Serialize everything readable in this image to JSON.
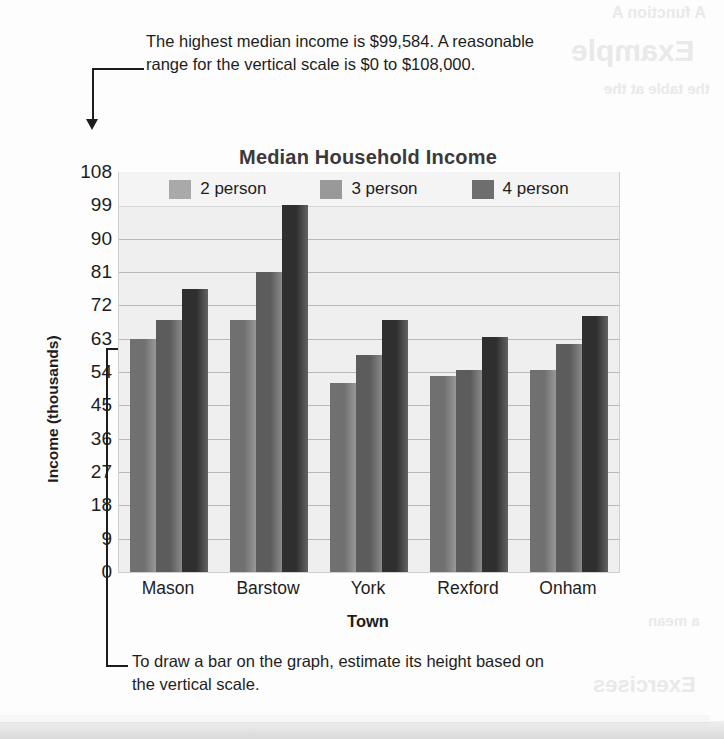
{
  "annotations": {
    "top": "The highest median income is $99,584. A reasonable range for the vertical scale is $0 to $108,000.",
    "bottom": "To draw a bar on the graph, estimate its height based on the vertical scale."
  },
  "ghost_text": {
    "g1": "A function A",
    "g2": "Example",
    "g3": "the table at the",
    "g4": "a mean",
    "g5": "Exercises"
  },
  "colors": {
    "series_2_person": "#a9a9a9",
    "series_3_person": "#999999",
    "series_4_person": "#6e6e6e",
    "plot_background": "#efefef",
    "gridline": "#b9b9b9",
    "text": "#1d1d1d",
    "title": "#3a3a3a"
  },
  "chart_data": {
    "type": "bar",
    "title": "Median Household Income",
    "xlabel": "Town",
    "ylabel": "Income (thousands)",
    "categories": [
      "Mason",
      "Barstow",
      "York",
      "Rexford",
      "Onham"
    ],
    "series": [
      {
        "name": "2 person",
        "values": [
          63,
          68,
          51,
          53,
          54.5
        ]
      },
      {
        "name": "3 person",
        "values": [
          68,
          81,
          58.5,
          54.5,
          61.5
        ]
      },
      {
        "name": "4 person",
        "values": [
          76.5,
          99,
          68,
          63.5,
          69
        ]
      }
    ],
    "ylim": [
      0,
      108
    ],
    "ytick_step": 9,
    "yticks": [
      108,
      99,
      90,
      81,
      72,
      63,
      54,
      45,
      36,
      27,
      18,
      9,
      0
    ],
    "grid": true,
    "legend_position": "top-inside"
  }
}
